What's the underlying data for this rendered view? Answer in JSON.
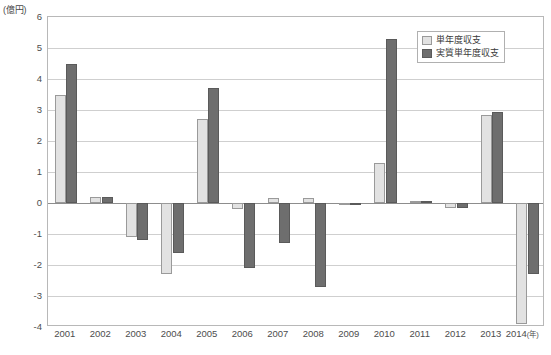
{
  "chart_data": {
    "type": "bar",
    "title": "",
    "xlabel": "(年)",
    "ylabel": "(億円)",
    "unit_label": "(億円)",
    "year_axis_suffix": "(年)",
    "ylim": [
      -4,
      6
    ],
    "yticks": [
      6,
      5,
      4,
      3,
      2,
      1,
      0,
      -1,
      -2,
      -3,
      -4
    ],
    "ytick_labels": [
      "6",
      "5",
      "4",
      "3",
      "2",
      "1",
      "0",
      "-1",
      "-2",
      "-3",
      "-4"
    ],
    "grid": true,
    "legend_position": "top-right",
    "categories": [
      "2001",
      "2002",
      "2003",
      "2004",
      "2005",
      "2006",
      "2007",
      "2008",
      "2009",
      "2010",
      "2011",
      "2012",
      "2013",
      "2014"
    ],
    "series": [
      {
        "name": "単年度収支",
        "color": "#e2e2e2",
        "border_color": "#9a9a9a",
        "values": [
          3.5,
          0.2,
          -1.1,
          -2.3,
          2.7,
          -0.2,
          0.15,
          0.15,
          -0.05,
          1.3,
          0.03,
          -0.15,
          2.85,
          -3.9
        ]
      },
      {
        "name": "実質単年度収支",
        "color": "#6e6e6e",
        "border_color": "#5a5a5a",
        "values": [
          4.5,
          0.2,
          -1.2,
          -1.6,
          3.7,
          -2.1,
          -1.3,
          -2.7,
          -0.05,
          5.3,
          0.03,
          -0.15,
          2.95,
          -2.3
        ]
      }
    ]
  },
  "legend": {
    "items": [
      {
        "label": "単年度収支"
      },
      {
        "label": "実質単年度収支"
      }
    ]
  },
  "footnote": {
    "text": ""
  }
}
